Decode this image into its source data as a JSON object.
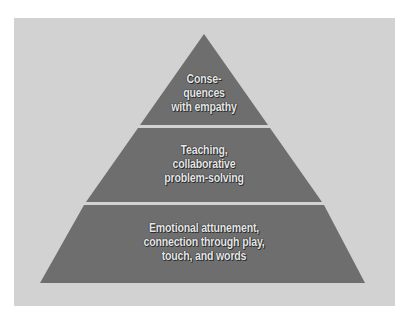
{
  "diagram": {
    "type": "pyramid",
    "colors": {
      "background": "#d2d2d2",
      "layer_fill": "#6e6e6e",
      "separator": "#e8e8e8",
      "text": "#e6e6e6"
    },
    "layers": [
      {
        "position": "top",
        "lines": [
          "Conse-",
          "quences",
          "with empathy"
        ]
      },
      {
        "position": "middle",
        "lines": [
          "Teaching,",
          "collaborative",
          "problem-solving"
        ]
      },
      {
        "position": "bottom",
        "lines": [
          "Emotional attunement,",
          "connection through play,",
          "touch, and words"
        ]
      }
    ]
  }
}
